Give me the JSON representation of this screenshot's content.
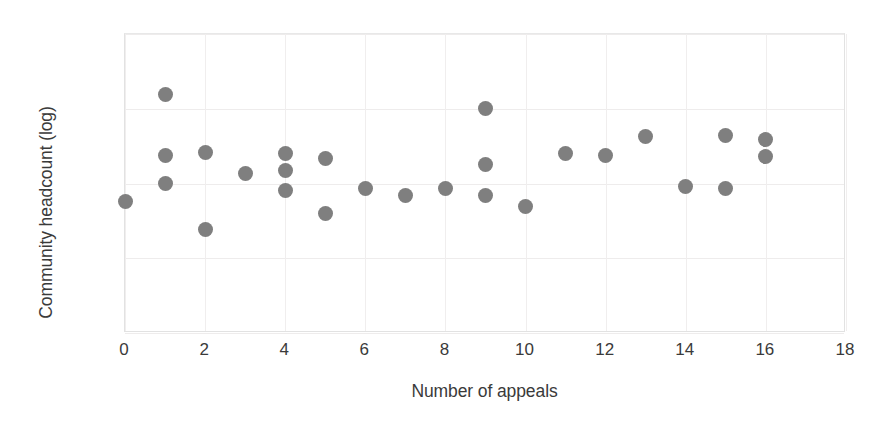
{
  "chart_data": {
    "type": "scatter",
    "title": "",
    "xlabel": "Number of appeals",
    "ylabel": "Community headcount (log)",
    "yscale": "log",
    "xlim": [
      0,
      18
    ],
    "ylim": [
      1,
      10000
    ],
    "xticks": [
      "0",
      "2",
      "4",
      "6",
      "8",
      "10",
      "12",
      "14",
      "16",
      "18"
    ],
    "xtick_values": [
      0,
      2,
      4,
      6,
      8,
      10,
      12,
      14,
      16,
      18
    ],
    "yticks": [
      "1",
      "10",
      "100",
      "1000",
      "10000"
    ],
    "ytick_values": [
      1,
      10,
      100,
      1000,
      10000
    ],
    "grid": true,
    "legend": "none",
    "marker_color": "#7f7f7f",
    "marker_shape": "circle",
    "series": [
      {
        "name": "communities",
        "points": [
          {
            "x": 0,
            "y": 58
          },
          {
            "x": 1,
            "y": 1550
          },
          {
            "x": 1,
            "y": 235
          },
          {
            "x": 1,
            "y": 100
          },
          {
            "x": 2,
            "y": 260
          },
          {
            "x": 2,
            "y": 24
          },
          {
            "x": 3,
            "y": 135
          },
          {
            "x": 4,
            "y": 250
          },
          {
            "x": 4,
            "y": 150
          },
          {
            "x": 4,
            "y": 80
          },
          {
            "x": 5,
            "y": 215
          },
          {
            "x": 5,
            "y": 40
          },
          {
            "x": 6,
            "y": 85
          },
          {
            "x": 7,
            "y": 70
          },
          {
            "x": 8,
            "y": 86
          },
          {
            "x": 9,
            "y": 1000
          },
          {
            "x": 9,
            "y": 180
          },
          {
            "x": 9,
            "y": 70
          },
          {
            "x": 10,
            "y": 50
          },
          {
            "x": 11,
            "y": 255
          },
          {
            "x": 12,
            "y": 235
          },
          {
            "x": 13,
            "y": 430
          },
          {
            "x": 14,
            "y": 90
          },
          {
            "x": 15,
            "y": 440
          },
          {
            "x": 15,
            "y": 87
          },
          {
            "x": 16,
            "y": 390
          },
          {
            "x": 16,
            "y": 230
          }
        ]
      }
    ]
  }
}
